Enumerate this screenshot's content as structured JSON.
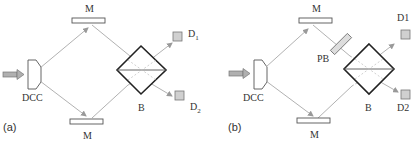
{
  "panels": [
    {
      "id": "a",
      "panel_label": "(a)",
      "labels": {
        "mirror_top": "M",
        "mirror_bottom": "M",
        "source": "DCC",
        "beamsplitter": "B",
        "detector_1": "D",
        "detector_1_sub": "1",
        "detector_2": "D",
        "detector_2_sub": "2"
      }
    },
    {
      "id": "b",
      "panel_label": "(b)",
      "labels": {
        "mirror_top": "M",
        "mirror_bottom": "M",
        "source": "DCC",
        "phase_element": "PB",
        "beamsplitter": "B",
        "detector_1": "D1",
        "detector_2": "D2"
      }
    }
  ],
  "colors": {
    "beam": "#a0a0a0",
    "outline": "#222222",
    "detector_fill": "#d0d0d0",
    "input_arrow_fill": "#b0b0b0"
  }
}
